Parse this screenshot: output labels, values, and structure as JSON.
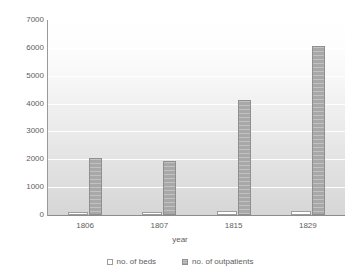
{
  "chart_data": {
    "type": "bar",
    "title": "",
    "xlabel": "year",
    "ylabel": "",
    "categories": [
      "1806",
      "1807",
      "1815",
      "1829"
    ],
    "series": [
      {
        "name": "no. of beds",
        "values": [
          110,
          105,
          145,
          160
        ]
      },
      {
        "name": "no. of outpatients",
        "values": [
          2050,
          1930,
          4140,
          6060
        ]
      }
    ],
    "ylim": [
      0,
      7000
    ],
    "yticks": [
      0,
      1000,
      2000,
      3000,
      4000,
      5000,
      6000,
      7000
    ],
    "ytick_labels": [
      "0",
      "1000",
      "2000",
      "3000",
      "4000",
      "5000",
      "6000",
      "7000"
    ],
    "grid": true,
    "legend_position": "bottom",
    "colors": {
      "beds": "#ffffff",
      "beds_edge": "#9c9c9c",
      "outpatients": "#a8a8a8",
      "outpatients_edge": "#8f8f8f",
      "gridline": "#ffffff",
      "axis": "#8c8c8c",
      "text": "#5e5e5e",
      "background": "#ffffff"
    }
  }
}
